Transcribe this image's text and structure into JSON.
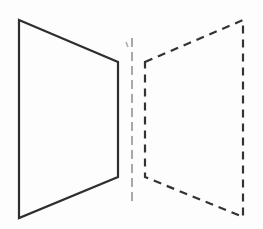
{
  "diagram": {
    "colors": {
      "background": "#fdfdfd",
      "original_stroke": "#2e2e2e",
      "image_stroke": "#333333",
      "axis_stroke": "#a8a8a8"
    },
    "original_shape": {
      "style": "solid",
      "points": [
        [
          19,
          20
        ],
        [
          118,
          62
        ],
        [
          118,
          177
        ],
        [
          19,
          218
        ]
      ]
    },
    "reflected_shape": {
      "style": "dashed",
      "points": [
        [
          145,
          62
        ],
        [
          243,
          20
        ],
        [
          243,
          217
        ],
        [
          145,
          177
        ]
      ]
    },
    "line_of_symmetry": {
      "style": "dashed",
      "x": 132,
      "y1": 38,
      "y2": 202
    }
  }
}
